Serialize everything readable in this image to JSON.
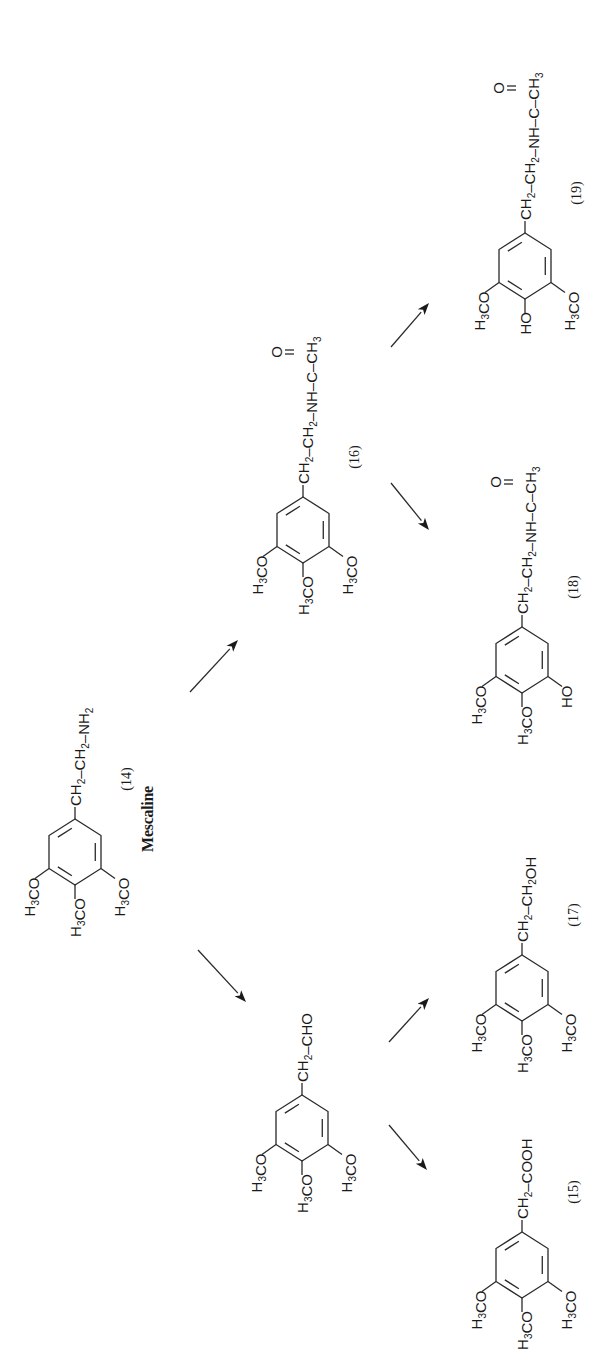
{
  "diagram": {
    "molecules": [
      {
        "id": "m14",
        "name": "molecule-mescaline",
        "number": "(14)",
        "caption": "Mescaline",
        "chain": [
          [
            "CH",
            "2"
          ],
          [
            "–CH",
            "2"
          ],
          [
            "–NH",
            "2"
          ]
        ],
        "carbonyl": false,
        "substituents": {
          "left": [
            [
              "H",
              "3"
            ],
            [
              "CO",
              ""
            ]
          ],
          "middle": [
            [
              "H",
              "3"
            ],
            [
              "CO",
              ""
            ]
          ],
          "right": [
            [
              "H",
              "3"
            ],
            [
              "CO",
              ""
            ]
          ]
        }
      },
      {
        "id": "m16",
        "name": "molecule-16",
        "number": "(16)",
        "chain": [
          [
            "CH",
            "2"
          ],
          [
            "–CH",
            "2"
          ],
          [
            "–NH–C–CH",
            "3"
          ]
        ],
        "carbonyl": true,
        "substituents": {
          "left": [
            [
              "H",
              "3"
            ],
            [
              "CO",
              ""
            ]
          ],
          "middle": [
            [
              "H",
              "3"
            ],
            [
              "CO",
              ""
            ]
          ],
          "right": [
            [
              "H",
              "3"
            ],
            [
              "CO",
              ""
            ]
          ]
        }
      },
      {
        "id": "m19",
        "name": "molecule-19",
        "number": "(19)",
        "chain": [
          [
            "CH",
            "2"
          ],
          [
            "–CH",
            "2"
          ],
          [
            "–NH–C–CH",
            "3"
          ]
        ],
        "carbonyl": true,
        "substituents": {
          "left": [
            [
              "H",
              "3"
            ],
            [
              "CO",
              ""
            ]
          ],
          "middle": [
            [
              "HO",
              ""
            ]
          ],
          "right": [
            [
              "H",
              "3"
            ],
            [
              "CO",
              ""
            ]
          ]
        }
      },
      {
        "id": "m18",
        "name": "molecule-18",
        "number": "(18)",
        "chain": [
          [
            "CH",
            "2"
          ],
          [
            "–CH",
            "2"
          ],
          [
            "–NH–C–CH",
            "3"
          ]
        ],
        "carbonyl": true,
        "substituents": {
          "left": [
            [
              "H",
              "3"
            ],
            [
              "CO",
              ""
            ]
          ],
          "middle": [
            [
              "H",
              "3"
            ],
            [
              "CO",
              ""
            ]
          ],
          "right": [
            [
              "HO",
              ""
            ]
          ]
        }
      },
      {
        "id": "mald",
        "name": "molecule-aldehyde",
        "number": "",
        "chain": [
          [
            "CH",
            "2"
          ],
          [
            "–CHO",
            ""
          ]
        ],
        "carbonyl": false,
        "substituents": {
          "left": [
            [
              "H",
              "3"
            ],
            [
              "CO",
              ""
            ]
          ],
          "middle": [
            [
              "H",
              "3"
            ],
            [
              "CO",
              ""
            ]
          ],
          "right": [
            [
              "H",
              "3"
            ],
            [
              "CO",
              ""
            ]
          ]
        }
      },
      {
        "id": "m17",
        "name": "molecule-17",
        "number": "(17)",
        "chain": [
          [
            "CH",
            "2"
          ],
          [
            "–CH",
            "2"
          ],
          [
            "OH",
            ""
          ]
        ],
        "carbonyl": false,
        "substituents": {
          "left": [
            [
              "H",
              "3"
            ],
            [
              "CO",
              ""
            ]
          ],
          "middle": [
            [
              "H",
              "3"
            ],
            [
              "CO",
              ""
            ]
          ],
          "right": [
            [
              "H",
              "3"
            ],
            [
              "CO",
              ""
            ]
          ]
        }
      },
      {
        "id": "m15",
        "name": "molecule-15",
        "number": "(15)",
        "chain": [
          [
            "CH",
            "2"
          ],
          [
            "–COOH",
            ""
          ]
        ],
        "carbonyl": false,
        "substituents": {
          "left": [
            [
              "H",
              "3"
            ],
            [
              "CO",
              ""
            ]
          ],
          "middle": [
            [
              "H",
              "3"
            ],
            [
              "CO",
              ""
            ]
          ],
          "right": [
            [
              "H",
              "3"
            ],
            [
              "CO",
              ""
            ]
          ]
        }
      }
    ],
    "arrows": [
      {
        "name": "arrow-14-to-16",
        "from": "m14",
        "to": "m16"
      },
      {
        "name": "arrow-14-to-aldehyde",
        "from": "m14",
        "to": "mald"
      },
      {
        "name": "arrow-16-to-19",
        "from": "m16",
        "to": "m19"
      },
      {
        "name": "arrow-16-to-18",
        "from": "m16",
        "to": "m18"
      },
      {
        "name": "arrow-aldehyde-to-17",
        "from": "mald",
        "to": "m17"
      },
      {
        "name": "arrow-aldehyde-to-15",
        "from": "mald",
        "to": "m15"
      }
    ],
    "carbonyl_oxygen": "O"
  }
}
